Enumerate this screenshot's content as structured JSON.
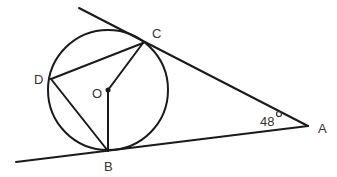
{
  "diagram": {
    "type": "circle-tangent-geometry",
    "points": {
      "A": {
        "label": "A",
        "x": 308,
        "y": 126
      },
      "B": {
        "label": "B",
        "x": 108,
        "y": 151
      },
      "C": {
        "label": "C",
        "x": 143,
        "y": 43
      },
      "D": {
        "label": "D",
        "x": 51,
        "y": 79
      },
      "O": {
        "label": "O",
        "x": 108,
        "y": 90
      }
    },
    "circle": {
      "center": "O",
      "radius": 60
    },
    "angle_A": {
      "value": "48°",
      "number": "48",
      "symbol": "°"
    },
    "segments": [
      "AC",
      "AB",
      "OC",
      "OB",
      "DC",
      "DB"
    ],
    "tangents": [
      "AC tangent at C",
      "AB tangent at B"
    ]
  }
}
